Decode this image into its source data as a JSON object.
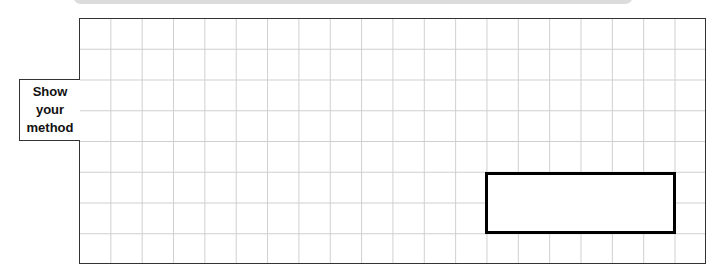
{
  "label": {
    "line1": "Show",
    "line2": "your",
    "line3": "method"
  },
  "grid": {
    "columns": 20,
    "rows": 8
  },
  "answer_box": {
    "value": ""
  }
}
